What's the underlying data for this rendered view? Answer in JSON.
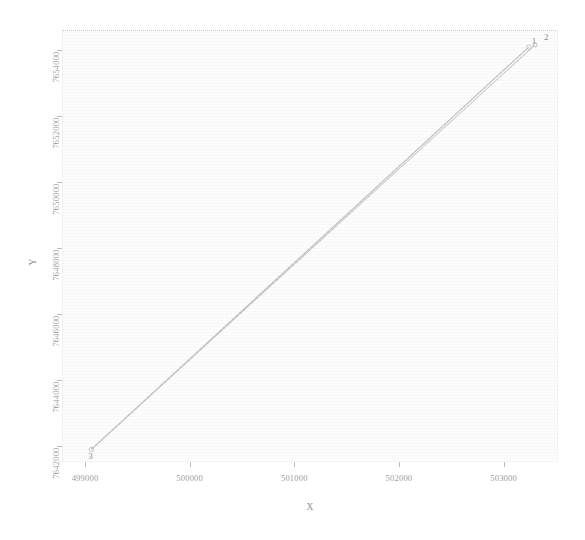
{
  "chart_data": {
    "type": "scatter",
    "title": "",
    "xlabel": "X",
    "ylabel": "Y",
    "xlim": [
      498780,
      503520
    ],
    "ylim": [
      7641500,
      7654600
    ],
    "xticks": [
      499000,
      500000,
      501000,
      502000,
      503000
    ],
    "xticklabels": [
      "499000",
      "500000",
      "501000",
      "502000",
      "503000"
    ],
    "yticks": [
      7642000,
      7644000,
      7646000,
      7648000,
      7650000,
      7652000,
      7654000
    ],
    "yticklabels": [
      "7642000",
      "7644000",
      "7646000",
      "7648000",
      "7650000",
      "7652000",
      "7654000"
    ],
    "grid": false,
    "legend": "none",
    "points": [
      {
        "label": "1",
        "x": 503240,
        "y": 7654080
      },
      {
        "label": "2",
        "x": 503300,
        "y": 7654150
      },
      {
        "label": "3",
        "x": 499060,
        "y": 7641880
      }
    ],
    "series": [
      {
        "name": "path-1-3",
        "x": [
          503240,
          499060
        ],
        "y": [
          7654080,
          7641880
        ],
        "color": "#b4b4b4"
      },
      {
        "name": "path-2-3",
        "x": [
          503300,
          499060
        ],
        "y": [
          7654150,
          7641880
        ],
        "color": "#c2c2c2"
      }
    ],
    "colors": {
      "line_primary": "#b4b4b4",
      "line_secondary": "#c2c2c2",
      "axis": "#bdbdbd",
      "text": "#9d9d9d",
      "background": "#ffffff",
      "plot_background": "#fdfdfd"
    }
  }
}
